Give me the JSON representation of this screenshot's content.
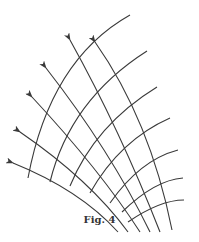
{
  "figure": {
    "caption": "Fig. 4",
    "stroke_color": "#3a3a3a",
    "background": "#ffffff",
    "flow_lines": [
      {
        "id": 1,
        "d": "M 172 230 Q 150 120 95 42",
        "arrow": [
          95,
          42
        ]
      },
      {
        "id": 2,
        "d": "M 160 232 Q 120 130 70 40",
        "arrow": [
          70,
          40
        ]
      },
      {
        "id": 3,
        "d": "M 150 232 Q 110 150 46 68",
        "arrow": [
          46,
          68
        ]
      },
      {
        "id": 4,
        "d": "M 140 232 Q 100 170 32 97",
        "arrow": [
          32,
          97
        ]
      },
      {
        "id": 5,
        "d": "M 128 232 Q 90 180 20 132",
        "arrow": [
          20,
          132
        ]
      },
      {
        "id": 6,
        "d": "M 118 232 Q 80 190 13 163",
        "arrow": [
          13,
          163
        ]
      }
    ],
    "arcs": [
      {
        "id": 1,
        "d": "M 28 178 Q 50 60 130 15"
      },
      {
        "id": 2,
        "d": "M 50 182 Q 70 100 147 51"
      },
      {
        "id": 3,
        "d": "M 70 186 Q 95 125 157 87"
      },
      {
        "id": 4,
        "d": "M 90 193 Q 120 140 170 118"
      },
      {
        "id": 5,
        "d": "M 110 203 Q 140 160 178 150"
      },
      {
        "id": 6,
        "d": "M 122 212 Q 155 180 183 178"
      },
      {
        "id": 7,
        "d": "M 128 222 Q 160 200 184 200"
      }
    ]
  }
}
